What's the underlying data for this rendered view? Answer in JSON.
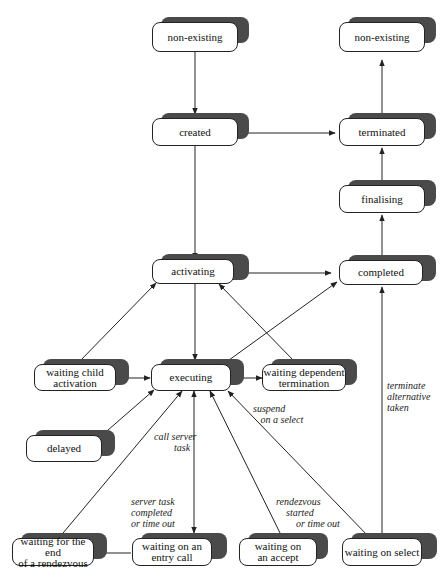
{
  "nodes": {
    "non_existing_left": "non-existing",
    "created": "created",
    "non_existing_right": "non-existing",
    "terminated": "terminated",
    "finalising": "finalising",
    "activating": "activating",
    "completed": "completed",
    "waiting_child_activation": "waiting child\nactivation",
    "executing": "executing",
    "waiting_dependent_termination": "waiting dependent\ntermination",
    "delayed": "delayed",
    "waiting_end_rendezvous": "waiting for the end\nof a rendezvous",
    "waiting_entry_call": "waiting on an\nentry call",
    "waiting_accept": "waiting on\nan accept",
    "waiting_select": "waiting on select"
  },
  "edge_labels": {
    "call_server_task": "call server\n        task",
    "server_task_completed": "server task\ncompleted\nor time out",
    "rendezvous_started": "rendezvous\n    started\n        or time out",
    "suspend_on_select": "suspend\n   on a select",
    "terminate_alternative": "terminate\nalternative\ntaken"
  },
  "colors": {
    "shadow": "#4a4a4a",
    "line": "#222222",
    "node_fill": "#ffffff"
  }
}
